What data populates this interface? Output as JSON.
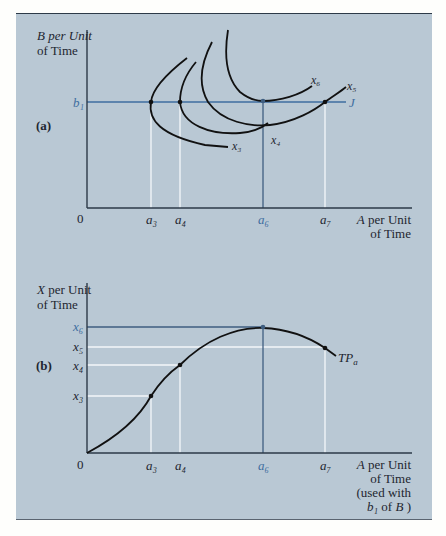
{
  "figure": {
    "panel_background": "#b9c8d4",
    "axis_color": "#2d3a48",
    "highlight_color": "#3f6ea0",
    "guide_color": "#f4f7fa"
  },
  "panel_a": {
    "label": "(a)",
    "y_axis_label_line1": "B per Unit",
    "y_axis_label_line2": "of Time",
    "x_axis_label_line1": "A per Unit",
    "x_axis_label_line2": "of Time",
    "origin": "0",
    "b_level": "b₁",
    "budget_line_label": "J",
    "x_ticks": [
      "a₃",
      "a₄",
      "a₆",
      "a₇"
    ],
    "isoquants": [
      "x₃",
      "x₄",
      "x₅",
      "x₆"
    ]
  },
  "panel_b": {
    "label": "(b)",
    "y_axis_label_line1": "X per Unit",
    "y_axis_label_line2": "of Time",
    "x_axis_label_line1": "A per Unit",
    "x_axis_label_line2": "of Time",
    "x_axis_label_line3": "(used with",
    "x_axis_label_line4_b": "b₁",
    "x_axis_label_line4_rest": " of B )",
    "origin": "0",
    "y_ticks": [
      "x₆",
      "x₅",
      "x₄",
      "x₃"
    ],
    "x_ticks": [
      "a₃",
      "a₄",
      "a₆",
      "a₇"
    ],
    "curve_label": "TP",
    "curve_label_sub": "a"
  }
}
